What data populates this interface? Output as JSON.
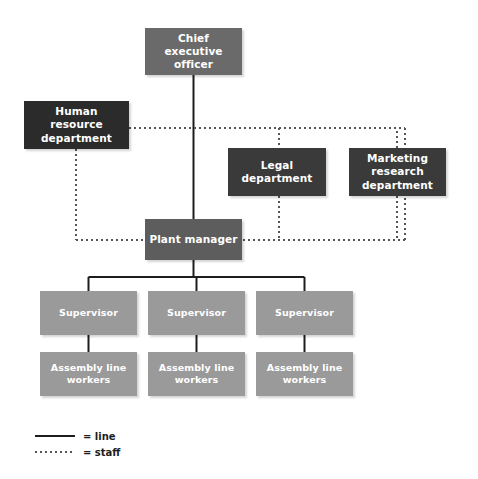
{
  "diagram": {
    "colors": {
      "background": "#ffffff",
      "executive": "#6a6a6a",
      "staff_dark": "#2b2b2b",
      "staff_department": "#3a3a3a",
      "plant_manager": "#5d5d5d",
      "operations": "#9a9a9a",
      "line_connector": "#1d1d1d",
      "staff_connector": "#555555",
      "node_text": "#ffffff",
      "legend_text": "#1d1d1d"
    },
    "nodes": [
      {
        "id": "ceo",
        "label": "Chief executive\nofficer",
        "level": "executive",
        "tone": "tone-exec"
      },
      {
        "id": "hr",
        "label": "Human resource\ndepartment",
        "level": "staff",
        "tone": "tone-dark"
      },
      {
        "id": "legal",
        "label": "Legal\ndepartment",
        "level": "staff",
        "tone": "tone-staff"
      },
      {
        "id": "marketing",
        "label": "Marketing\nresearch\ndepartment",
        "level": "staff",
        "tone": "tone-staff"
      },
      {
        "id": "plant",
        "label": "Plant manager",
        "level": "management",
        "tone": "tone-mid"
      },
      {
        "id": "sup1",
        "label": "Supervisor",
        "level": "supervision",
        "tone": "tone-light"
      },
      {
        "id": "sup2",
        "label": "Supervisor",
        "level": "supervision",
        "tone": "tone-light"
      },
      {
        "id": "sup3",
        "label": "Supervisor",
        "level": "supervision",
        "tone": "tone-light"
      },
      {
        "id": "alw1",
        "label": "Assembly line\nworkers",
        "level": "operations",
        "tone": "tone-light"
      },
      {
        "id": "alw2",
        "label": "Assembly line\nworkers",
        "level": "operations",
        "tone": "tone-light"
      },
      {
        "id": "alw3",
        "label": "Assembly line\nworkers",
        "level": "operations",
        "tone": "tone-light"
      }
    ],
    "connections": {
      "line": [
        {
          "from": "ceo",
          "to": "plant"
        },
        {
          "from": "plant",
          "to": "sup1"
        },
        {
          "from": "plant",
          "to": "sup2"
        },
        {
          "from": "plant",
          "to": "sup3"
        },
        {
          "from": "sup1",
          "to": "alw1"
        },
        {
          "from": "sup2",
          "to": "alw2"
        },
        {
          "from": "sup3",
          "to": "alw3"
        }
      ],
      "staff": [
        {
          "from": "hr",
          "to": "plant"
        },
        {
          "from": "legal",
          "to": "plant"
        },
        {
          "from": "marketing",
          "to": "plant"
        },
        {
          "from": "hr",
          "to": "legal"
        },
        {
          "from": "hr",
          "to": "marketing"
        }
      ]
    },
    "legend": {
      "items": [
        {
          "id": "line",
          "style": "solid",
          "label": "= line"
        },
        {
          "id": "staff",
          "style": "dotted",
          "label": "= staff"
        }
      ]
    }
  }
}
